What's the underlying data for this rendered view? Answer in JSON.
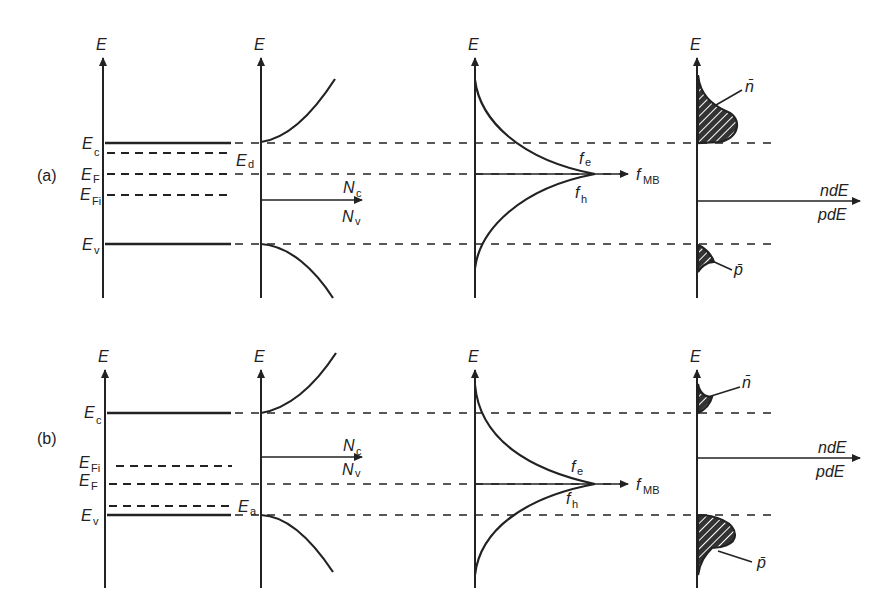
{
  "figure": {
    "panels": [
      {
        "id": "a",
        "label": "(a)",
        "energy_levels": {
          "Ec": "E",
          "Ec_sub": "c",
          "EF": "E",
          "EF_sub": "F",
          "EFi": "E",
          "EFi_sub": "Fi",
          "Ev": "E",
          "Ev_sub": "v",
          "Ed": "E",
          "Ed_sub": "d"
        },
        "dos_axis": {
          "top": "N",
          "top_sub": "c",
          "bottom": "N",
          "bottom_sub": "v"
        },
        "dist_axis": {
          "label": "f",
          "label_sub": "MB",
          "fe": "f",
          "fe_sub": "e",
          "fh": "f",
          "fh_sub": "h"
        },
        "carrier_axis": {
          "top": "ndE",
          "bottom": "pdE",
          "n": "n̄",
          "p": "p̄"
        }
      },
      {
        "id": "b",
        "label": "(b)",
        "energy_levels": {
          "Ec": "E",
          "Ec_sub": "c",
          "EFi": "E",
          "EFi_sub": "Fi",
          "EF": "E",
          "EF_sub": "F",
          "Ev": "E",
          "Ev_sub": "v",
          "Ea": "E",
          "Ea_sub": "a"
        },
        "dos_axis": {
          "top": "N",
          "top_sub": "c",
          "bottom": "N",
          "bottom_sub": "v"
        },
        "dist_axis": {
          "label": "f",
          "label_sub": "MB",
          "fe": "f",
          "fe_sub": "e",
          "fh": "f",
          "fh_sub": "h"
        },
        "carrier_axis": {
          "top": "ndE",
          "bottom": "pdE",
          "n": "n̄",
          "p": "p̄"
        }
      }
    ],
    "axis_label": "E"
  }
}
